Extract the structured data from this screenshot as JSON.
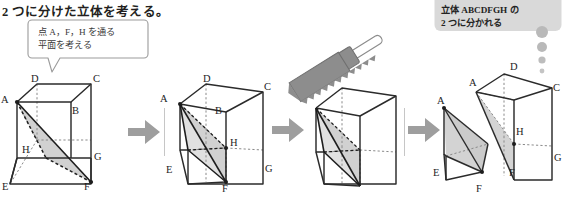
{
  "headline": "2 つに分けた立体を考える。",
  "callouts": {
    "left": {
      "name": "plane-hint-bubble",
      "line1": "点 A，F，H を通る",
      "line2": "平面を考える",
      "fill": "#ffffff",
      "stroke": "#9b9b9b"
    },
    "right": {
      "name": "result-bubble",
      "line1": "立体 ABCDFGH の",
      "line2": "2 つに分かれる",
      "fill": "#d9d9d9",
      "dots": 4
    }
  },
  "panels": [
    {
      "id": "panel-1",
      "caption": "cube-with-plane-AFH",
      "labels": [
        "D",
        "C",
        "A",
        "B",
        "H",
        "G",
        "E",
        "F"
      ],
      "shaded": true
    },
    {
      "id": "panel-2",
      "caption": "cube-tetrahedron-highlighted",
      "labels": [
        "D",
        "A",
        "C",
        "B",
        "H",
        "E",
        "G",
        "F"
      ],
      "shaded": true
    },
    {
      "id": "panel-3",
      "caption": "cube-being-cut-by-saw",
      "labels": [],
      "shaded": true
    },
    {
      "id": "panel-4",
      "caption": "cube-split-into-two-solids",
      "labels": [
        "D",
        "A",
        "A",
        "C",
        "H",
        "G",
        "E",
        "F",
        "F"
      ],
      "shaded": true
    }
  ],
  "arrows": [
    {
      "name": "arrow-1-to-2"
    },
    {
      "name": "arrow-2-to-3"
    },
    {
      "name": "arrow-3-to-4"
    }
  ],
  "colors": {
    "ink": "#231f20",
    "edge": "#2b2b2b",
    "hidden_edge": "#7a7a7a",
    "shade_fill": "#cfcfcf",
    "arrow": "#9e9e9e",
    "bubble_gray": "#d9d9d9",
    "saw_blade": "#8d8d8d",
    "divider": "#bdbdbd",
    "page": "#ffffff"
  }
}
